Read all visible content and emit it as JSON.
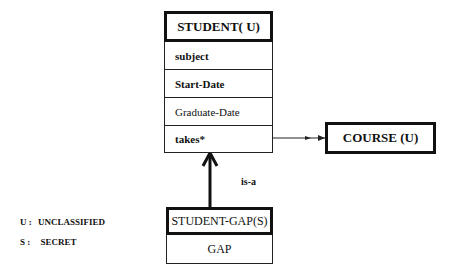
{
  "classes": {
    "student": {
      "title": "STUDENT( U)",
      "attributes": [
        "subject",
        "Start-Date",
        "Graduate-Date",
        "takes*"
      ]
    },
    "course": {
      "title": "COURSE (U)"
    },
    "student_gap": {
      "title": "STUDENT-GAP(S)",
      "attributes": [
        "GAP"
      ]
    }
  },
  "relations": {
    "takes_to_course": {
      "from": "STUDENT.takes*",
      "to": "COURSE (U)"
    },
    "isa": {
      "from": "STUDENT-GAP(S)",
      "to": "STUDENT( U)",
      "label": "is-a"
    }
  },
  "legend": [
    {
      "key": "U :",
      "value": "UNCLASSIFIED"
    },
    {
      "key": "S :",
      "value": "SECRET"
    }
  ]
}
